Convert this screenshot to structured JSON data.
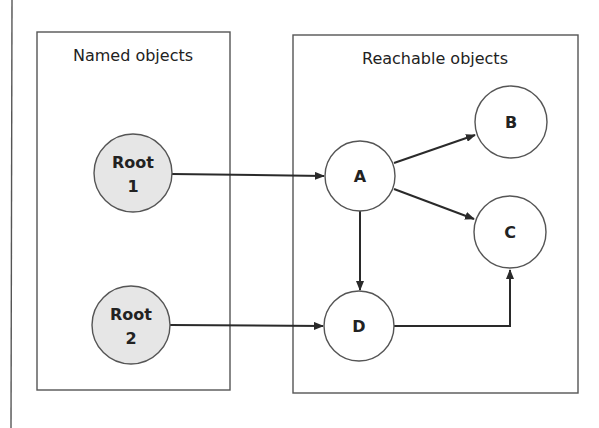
{
  "diagram": {
    "groups": [
      {
        "id": "named",
        "title": "Named objects"
      },
      {
        "id": "reachable",
        "title": "Reachable objects"
      }
    ],
    "nodes": {
      "root1": {
        "line1": "Root",
        "line2": "1",
        "fill": "#e6e6e6"
      },
      "root2": {
        "line1": "Root",
        "line2": "2",
        "fill": "#e6e6e6"
      },
      "a": {
        "label": "A",
        "fill": "#ffffff"
      },
      "b": {
        "label": "B",
        "fill": "#ffffff"
      },
      "c": {
        "label": "C",
        "fill": "#ffffff"
      },
      "d": {
        "label": "D",
        "fill": "#ffffff"
      }
    },
    "edges": [
      {
        "from": "Root 1",
        "to": "A"
      },
      {
        "from": "Root 2",
        "to": "D"
      },
      {
        "from": "A",
        "to": "B"
      },
      {
        "from": "A",
        "to": "C"
      },
      {
        "from": "A",
        "to": "D"
      },
      {
        "from": "D",
        "to": "C"
      }
    ]
  }
}
